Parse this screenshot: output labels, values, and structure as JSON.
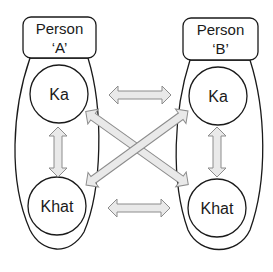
{
  "diagram": {
    "person_a": {
      "title_line1": "Person",
      "title_line2": "‘A’",
      "ka_label": "Ka",
      "khat_label": "Khat"
    },
    "person_b": {
      "title_line1": "Person",
      "title_line2": "‘B’",
      "ka_label": "Ka",
      "khat_label": "Khat"
    },
    "arrows": [
      {
        "from": "A.Ka",
        "to": "B.Ka",
        "type": "double-headed"
      },
      {
        "from": "A.Khat",
        "to": "B.Khat",
        "type": "double-headed"
      },
      {
        "from": "A.Ka",
        "to": "A.Khat",
        "type": "double-headed"
      },
      {
        "from": "B.Ka",
        "to": "B.Khat",
        "type": "double-headed"
      },
      {
        "from": "A.Ka",
        "to": "B.Khat",
        "type": "double-headed"
      },
      {
        "from": "B.Ka",
        "to": "A.Khat",
        "type": "double-headed"
      }
    ],
    "colors": {
      "stroke": "#1a1a1a",
      "arrow_fill": "#e6e6e6",
      "arrow_stroke": "#8c8c8c",
      "background": "#ffffff"
    }
  }
}
